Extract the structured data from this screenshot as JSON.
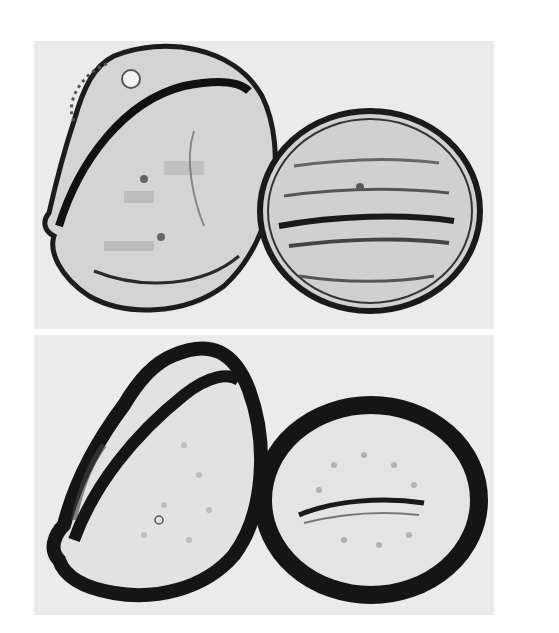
{
  "figure": {
    "panels": [
      {
        "id": "top",
        "description": "Two pollen grains, light micrograph, thin wall outlines; left grain tilted with collapsed flank, right grain ellipsoid with equatorial furrow"
      },
      {
        "id": "bottom",
        "description": "Same two pollen grains at different focus with thick dark wall outlines; right grain shows elongated colpus across middle"
      }
    ],
    "colors": {
      "background": "#ffffff",
      "panel": "#ebebeb",
      "wall": "#1a1a1a",
      "interior": "#d2d2d2"
    }
  }
}
